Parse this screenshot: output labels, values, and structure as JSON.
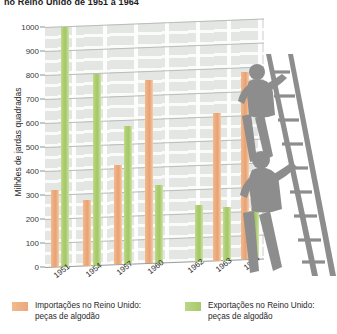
{
  "chart_data": {
    "type": "bar",
    "title": "no Reino Unido de 1951 a 1964",
    "xlabel": "",
    "ylabel": "Milhões de jardas quadradas",
    "ylim": [
      0,
      1000
    ],
    "ytick_step": 100,
    "grid": true,
    "legend_position": "bottom",
    "categories": [
      "1951",
      "1954",
      "1957",
      "1960",
      "1962",
      "1963",
      "1964"
    ],
    "series": [
      {
        "name": "Importações no Reino Unido:\npeças de algodão",
        "color": "#eea97a",
        "values": [
          320,
          275,
          415,
          765,
          0,
          615,
          780
        ]
      },
      {
        "name": "Exportações no Reino Unido:\npeças de algodão",
        "color": "#a9cc6e",
        "values": [
          1000,
          800,
          575,
          325,
          235,
          225,
          215
        ]
      }
    ],
    "yticks": [
      "0",
      "100",
      "200",
      "300",
      "400",
      "500",
      "600",
      "700",
      "800",
      "900",
      "1000"
    ]
  },
  "legend": {
    "imports_label": "Importações no Reino Unido:\npeças de algodão",
    "exports_label": "Exportações no Reino Unido:\npeças de algodão"
  },
  "illustration": {
    "name": "two-workers-on-ladder-silhouette",
    "color": "#8c8c8c"
  }
}
